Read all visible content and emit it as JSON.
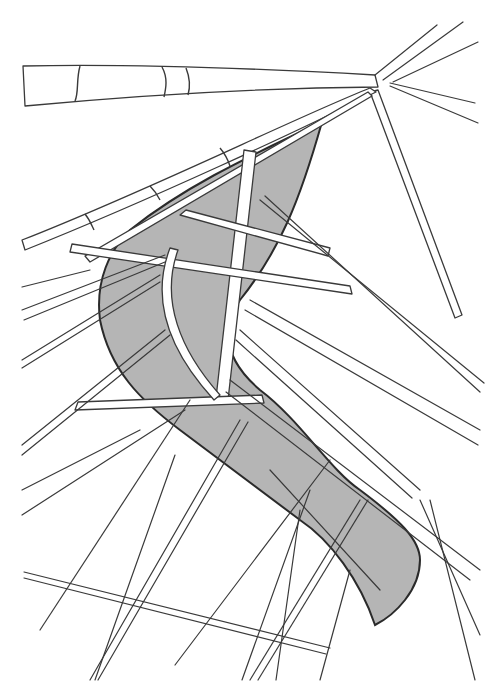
{
  "drawing": {
    "subject": "bamboo frame structure sketch",
    "fill_color": "#b5b5b5",
    "line_color": "#3a3a3a",
    "background": "#ffffff"
  }
}
